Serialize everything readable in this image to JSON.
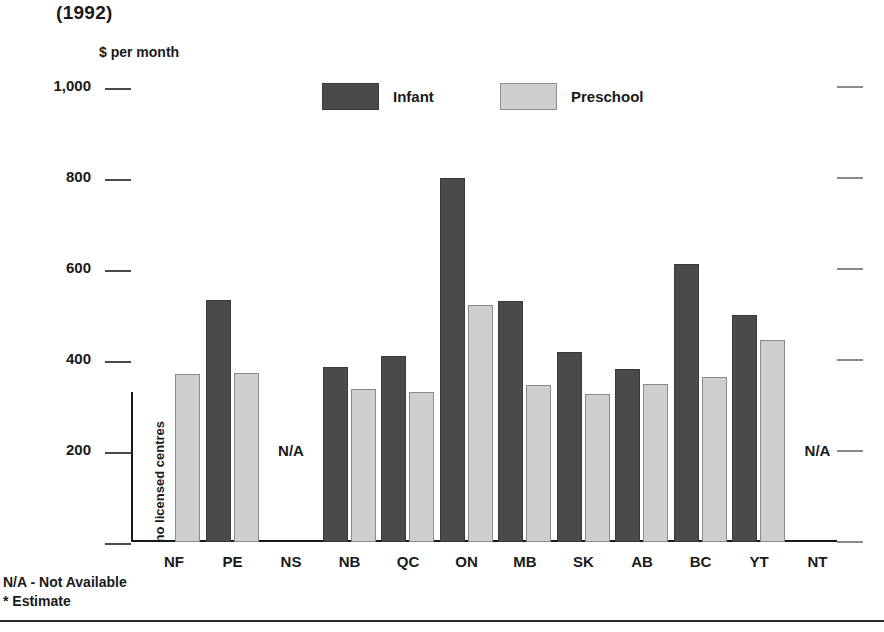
{
  "header": {
    "year_title": "(1992)",
    "y_axis_unit": "$ per month"
  },
  "legend": {
    "items": [
      {
        "label": "Infant",
        "swatch": "dark-gray-swatch",
        "color": "#4a4a4a"
      },
      {
        "label": "Preschool",
        "swatch": "light-gray-swatch",
        "color": "#cfcfcf"
      }
    ]
  },
  "footnotes": {
    "line1": "N/A - Not Available",
    "line2": "* Estimate"
  },
  "labels": {
    "not_available": "N/A",
    "no_licensed_centres": "no licensed centres"
  },
  "chart_data": {
    "type": "bar",
    "title": "(1992)",
    "xlabel": "",
    "ylabel": "$ per month",
    "ylim": [
      0,
      1000
    ],
    "yticks": [
      0,
      200,
      400,
      600,
      800,
      1000
    ],
    "ytick_labels": [
      "",
      "200",
      "400",
      "600",
      "800",
      "1,000"
    ],
    "grid": false,
    "legend_position": "top-center",
    "categories": [
      "NF",
      "PE",
      "NS",
      "NB",
      "QC",
      "ON",
      "MB",
      "SK",
      "AB",
      "BC",
      "YT",
      "NT"
    ],
    "series": [
      {
        "name": "Infant",
        "color": "#4a4a4a",
        "values": [
          null,
          533,
          null,
          384,
          408,
          800,
          530,
          418,
          380,
          610,
          500,
          null
        ]
      },
      {
        "name": "Preschool",
        "color": "#cfcfcf",
        "values": [
          370,
          372,
          null,
          337,
          330,
          521,
          346,
          325,
          347,
          363,
          445,
          null
        ]
      }
    ],
    "annotations": [
      {
        "category": "NF",
        "series": "Infant",
        "text": "no licensed centres",
        "orientation": "vertical"
      },
      {
        "category": "NS",
        "text": "N/A"
      },
      {
        "category": "NT",
        "text": "N/A"
      }
    ]
  }
}
